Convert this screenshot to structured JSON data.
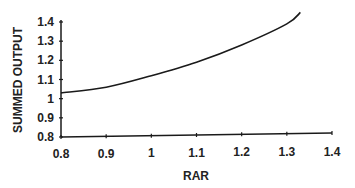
{
  "chart_data": {
    "type": "line",
    "title": "",
    "xlabel": "RAR",
    "ylabel": "SUMMED OUTPUT",
    "xlim": [
      0.8,
      1.4
    ],
    "ylim": [
      0.8,
      1.4
    ],
    "x_ticks": [
      "0.8",
      "0.9",
      "1",
      "1.1",
      "1.2",
      "1.3",
      "1.4"
    ],
    "y_ticks": [
      "0.8",
      "0.9",
      "1",
      "1.1",
      "1.2",
      "1.3",
      "1.4"
    ],
    "grid": false,
    "legend": null,
    "series": [
      {
        "name": "summed output",
        "x": [
          0.8,
          0.9,
          1.0,
          1.1,
          1.2,
          1.3,
          1.33
        ],
        "values": [
          1.03,
          1.06,
          1.12,
          1.19,
          1.28,
          1.39,
          1.45
        ]
      }
    ]
  },
  "colors": {
    "line": "#1a1a1a",
    "axis": "#1a1a1a",
    "background": "#ffffff"
  }
}
